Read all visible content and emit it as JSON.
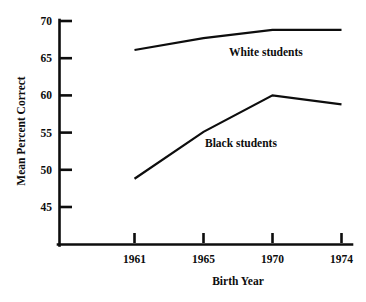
{
  "chart_data": {
    "type": "line",
    "title": "",
    "subtitle": "",
    "xlabel": "Birth Year",
    "ylabel": "Mean Percent Correct",
    "categories": [
      "1961",
      "1965",
      "1970",
      "1974"
    ],
    "xtick_labels": [
      "1961",
      "1965",
      "1970",
      "1974"
    ],
    "ytick_labels": [
      "45",
      "50",
      "55",
      "60",
      "65",
      "70"
    ],
    "yticks": [
      45,
      50,
      55,
      60,
      65,
      70
    ],
    "ylim": [
      41.5,
      70
    ],
    "grid": false,
    "legend_position": "inline-annotation",
    "series": [
      {
        "name": "White students",
        "label": "White students",
        "values": [
          66.1,
          67.7,
          68.8,
          68.8
        ],
        "color": "#0d0d0d"
      },
      {
        "name": "Black students",
        "label": "Black students",
        "values": [
          48.8,
          55.1,
          60.0,
          58.8
        ],
        "color": "#0d0d0d"
      }
    ],
    "annotations": [
      {
        "text": "White students",
        "series": "White students"
      },
      {
        "text": "Black students",
        "series": "Black students"
      }
    ]
  },
  "colors": {
    "ink": "#0d0d0d",
    "background": "#ffffff"
  }
}
